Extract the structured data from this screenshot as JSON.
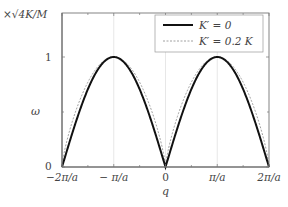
{
  "chart_data": {
    "type": "line",
    "title": "",
    "xlabel": "q",
    "ylabel": "ω",
    "y_unit_label": "×√4K/M",
    "xlim": [
      -6.2832,
      6.2832
    ],
    "ylim": [
      0,
      1
    ],
    "grid": {
      "vertical_at": [
        "-π/a",
        "0",
        "π/a"
      ]
    },
    "x_ticks": [
      "−2π/a",
      "− π/a",
      "0",
      "π/a",
      "2π/a"
    ],
    "y_ticks": [
      "0",
      "1"
    ],
    "legend": {
      "position": "upper-right",
      "entries": [
        "K′ = 0",
        "K′ = 0.2 K"
      ]
    },
    "series": [
      {
        "name": "K′ = 0",
        "style": "solid-thick",
        "color": "#111111",
        "formula": "|sin(qa/2)|",
        "x": [
          "-2π/a",
          "-3π/2a",
          "-π/a",
          "-π/2a",
          "0",
          "π/2a",
          "π/a",
          "3π/2a",
          "2π/a"
        ],
        "values": [
          0,
          0.707,
          1,
          0.707,
          0,
          0.707,
          1,
          0.707,
          0
        ]
      },
      {
        "name": "K′ = 0.2 K",
        "style": "dashed-thin",
        "color": "#888888",
        "formula": "|sin(qa/2)|^0.75 (approx.)",
        "x": [
          "-2π/a",
          "-3π/2a",
          "-π/a",
          "-π/2a",
          "0",
          "π/2a",
          "π/a",
          "3π/2a",
          "2π/a"
        ],
        "values": [
          0,
          0.77,
          1,
          0.77,
          0,
          0.77,
          1,
          0.77,
          0
        ]
      }
    ]
  },
  "axes": {
    "y_unit_label": "×√4K/M",
    "y_label": "ω",
    "x_label": "q",
    "x_ticks": [
      "−2π/a",
      "− π/a",
      "0",
      "π/a",
      "2π/a"
    ],
    "y_ticks": [
      "0",
      "1"
    ]
  },
  "legend": {
    "entry_1": "K′ = 0",
    "entry_2": "K′ = 0.2 K"
  }
}
